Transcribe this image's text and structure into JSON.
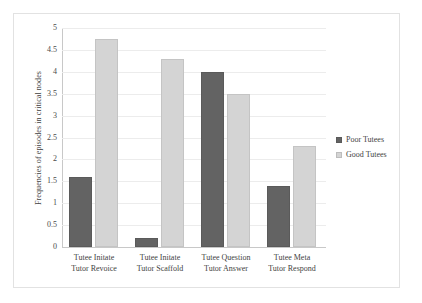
{
  "chart_data": {
    "type": "bar",
    "title": "",
    "xlabel": "",
    "ylabel": "Frequencies of episodes in critical nodes",
    "ylim": [
      0,
      5
    ],
    "yticks": [
      "0",
      "0.5",
      "1",
      "1.5",
      "2",
      "2.5",
      "3",
      "3.5",
      "4",
      "4.5",
      "5"
    ],
    "grid": true,
    "legend_position": "right",
    "categories": [
      {
        "line1": "Tutee Initate",
        "line2": "Tutor Revoice"
      },
      {
        "line1": "Tutee Initate",
        "line2": "Tutor Scaffold"
      },
      {
        "line1": "Tutee Question",
        "line2": "Tutor Answer"
      },
      {
        "line1": "Tutee Meta",
        "line2": "Tutor Respond"
      }
    ],
    "series": [
      {
        "name": "Poor Tutees",
        "color": "#636363",
        "values": [
          1.6,
          0.2,
          4.0,
          1.4
        ]
      },
      {
        "name": "Good Tutees",
        "color": "#d4d4d4",
        "values": [
          4.75,
          4.3,
          3.5,
          2.3
        ]
      }
    ]
  },
  "legend": {
    "items": [
      {
        "label": "Poor Tutees"
      },
      {
        "label": "Good Tutees"
      }
    ]
  }
}
